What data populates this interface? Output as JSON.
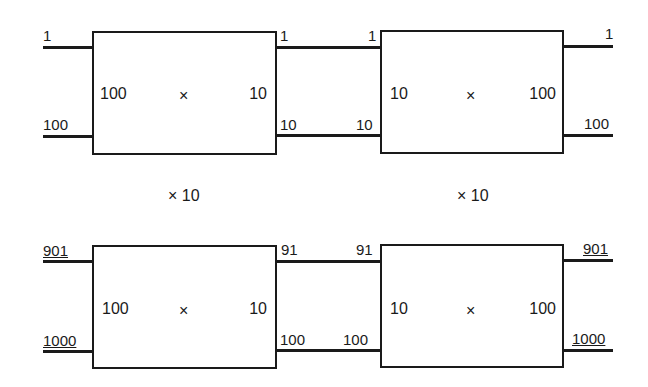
{
  "diagram": {
    "rows": [
      {
        "id": "top",
        "stages": [
          {
            "inner_left": "100",
            "inner_center": "×",
            "inner_right": "10",
            "in_top": "1",
            "in_bottom": "100",
            "out_top": "1",
            "out_bottom": "10"
          },
          {
            "inner_left": "10",
            "inner_center": "×",
            "inner_right": "100",
            "in_top": "1",
            "in_bottom": "10",
            "out_top": "1",
            "out_bottom": "100"
          }
        ]
      },
      {
        "id": "bottom",
        "stages": [
          {
            "inner_left": "100",
            "inner_center": "×",
            "inner_right": "10",
            "in_top": "901",
            "in_bottom": "1000",
            "out_top": "91",
            "out_bottom": "100"
          },
          {
            "inner_left": "10",
            "inner_center": "×",
            "inner_right": "100",
            "in_top": "91",
            "in_bottom": "100",
            "out_top": "901",
            "out_bottom": "1000"
          }
        ]
      }
    ],
    "multipliers": [
      "× 10",
      "× 10"
    ]
  }
}
